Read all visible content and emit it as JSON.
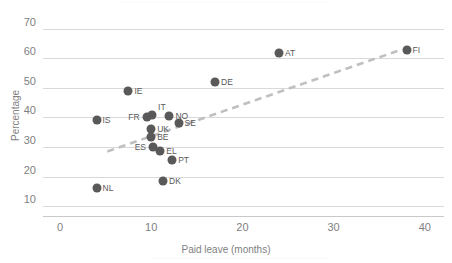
{
  "chart": {
    "type": "scatter",
    "title": "",
    "xlabel": "Paid leave (months)",
    "ylabel": "Percentage",
    "xlim": [
      -1.7,
      43
    ],
    "ylim": [
      7.5,
      73
    ],
    "xticks": [
      0,
      10,
      20,
      30,
      40
    ],
    "yticks": [
      10,
      20,
      30,
      40,
      50,
      60,
      70
    ],
    "grid": true,
    "legend": "none",
    "marker_color": "#595959",
    "grid_color": "#d9d9d9",
    "trendline_color": "#bfbfbf",
    "trendline": {
      "style": "dashed",
      "x0": 5.2,
      "y0": 28.5,
      "x1": 37.0,
      "y1": 62.5
    }
  },
  "chart_data": {
    "type": "scatter",
    "title": "",
    "xlabel": "Paid leave (months)",
    "ylabel": "Percentage",
    "xlim": [
      -1.7,
      43
    ],
    "ylim": [
      7.5,
      73
    ],
    "xticks": [
      0,
      10,
      20,
      30,
      40
    ],
    "yticks": [
      10,
      20,
      30,
      40,
      50,
      60,
      70
    ],
    "grid": true,
    "legend": "none",
    "points": [
      {
        "label": "NL",
        "x": 4.0,
        "y": 16.0,
        "side": "right"
      },
      {
        "label": "IS",
        "x": 4.0,
        "y": 39.0,
        "side": "right"
      },
      {
        "label": "IE",
        "x": 7.5,
        "y": 49.0,
        "side": "right"
      },
      {
        "label": "FR",
        "x": 9.5,
        "y": 40.0,
        "side": "left"
      },
      {
        "label": "IT",
        "x": 10.1,
        "y": 41.0,
        "side": "right"
      },
      {
        "label": "UK",
        "x": 10.0,
        "y": 36.0,
        "side": "right"
      },
      {
        "label": "BE",
        "x": 10.0,
        "y": 33.5,
        "side": "right"
      },
      {
        "label": "ES",
        "x": 10.2,
        "y": 30.0,
        "side": "left"
      },
      {
        "label": "EL",
        "x": 11.0,
        "y": 28.5,
        "side": "right"
      },
      {
        "label": "DK",
        "x": 11.3,
        "y": 18.5,
        "side": "right"
      },
      {
        "label": "NO",
        "x": 12.0,
        "y": 40.5,
        "side": "right"
      },
      {
        "label": "PT",
        "x": 12.3,
        "y": 25.5,
        "side": "right"
      },
      {
        "label": "SE",
        "x": 13.0,
        "y": 38.0,
        "side": "right"
      },
      {
        "label": "DE",
        "x": 17.0,
        "y": 52.0,
        "side": "right"
      },
      {
        "label": "AT",
        "x": 24.0,
        "y": 62.0,
        "side": "right"
      },
      {
        "label": "FI",
        "x": 38.0,
        "y": 63.0,
        "side": "right"
      }
    ],
    "trendline": {
      "style": "dashed",
      "x0": 5.2,
      "y0": 28.5,
      "x1": 37.0,
      "y1": 62.5
    }
  }
}
